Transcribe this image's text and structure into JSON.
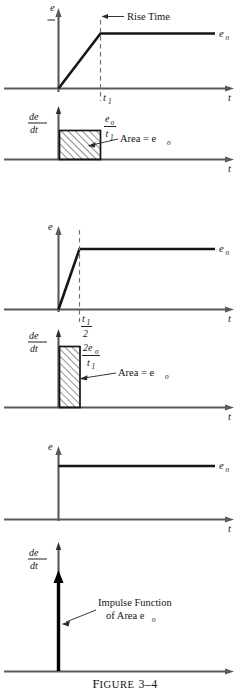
{
  "figure": {
    "caption_label": "Figure",
    "caption_number": "3–4",
    "caption_full": "FIGURE 3–4"
  },
  "panels": [
    {
      "id": "panel-1-ramp",
      "top_plot": {
        "y_axis_label": "e",
        "x_axis_label": "t",
        "output_label": "e",
        "output_sub": "o",
        "annotation": "Rise Time",
        "tick_label": "t",
        "tick_sub": "1"
      },
      "bottom_plot": {
        "y_axis_label_num": "de",
        "y_axis_label_den": "dt",
        "x_axis_label": "t",
        "height_num": "e",
        "height_num_sub": "o",
        "height_den": "t",
        "height_den_sub": "1",
        "area_label": "Area = e",
        "area_label_sub": "o"
      }
    },
    {
      "id": "panel-2-ramp-half",
      "top_plot": {
        "y_axis_label": "e",
        "x_axis_label": "t",
        "output_label": "e",
        "output_sub": "o",
        "tick_num": "t",
        "tick_num_sub": "1",
        "tick_den": "2"
      },
      "bottom_plot": {
        "y_axis_label_num": "de",
        "y_axis_label_den": "dt",
        "x_axis_label": "t",
        "height_num": "2e",
        "height_num_sub": "o",
        "height_den": "t",
        "height_den_sub": "1",
        "area_label": "Area = e",
        "area_label_sub": "o"
      }
    },
    {
      "id": "panel-3-step",
      "top_plot": {
        "y_axis_label": "e",
        "x_axis_label": "t",
        "output_label": "e",
        "output_sub": "o"
      },
      "bottom_plot": {
        "y_axis_label_num": "de",
        "y_axis_label_den": "dt",
        "x_axis_label": "t",
        "impulse_line1": "Impulse Function",
        "impulse_line2": "of Area e",
        "impulse_line2_sub": "o"
      }
    }
  ],
  "colors": {
    "axis": "#555a5e",
    "curve": "#161616",
    "dash": "#6d7276",
    "hatch": "#2b2b2b",
    "background": "#ffffff"
  }
}
